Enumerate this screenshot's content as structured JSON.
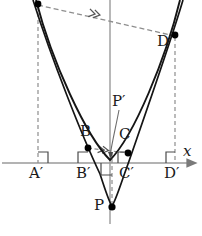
{
  "figure": {
    "width": 202,
    "height": 236,
    "background": "#ffffff",
    "colors": {
      "curve": "#111111",
      "dashed": "#808080",
      "axis": "#9a9a9a",
      "point": "#000000",
      "text": "#1a1a1a"
    }
  },
  "axes": {
    "x_axis_label": "x",
    "x_axis_y": 163,
    "y_axis_x": 110,
    "x_axis_arrow": true
  },
  "points": [
    {
      "id": "A",
      "label": "",
      "x": 38,
      "y": 4,
      "dot": true
    },
    {
      "id": "B",
      "label": "B",
      "x": 88,
      "y": 148,
      "dot": true,
      "label_x": 80,
      "label_y": 128
    },
    {
      "id": "C",
      "label": "C",
      "x": 128,
      "y": 153,
      "dot": true,
      "label_x": 120,
      "label_y": 131
    },
    {
      "id": "D",
      "label": "D",
      "x": 175,
      "y": 35,
      "dot": true,
      "label_x": 158,
      "label_y": 38
    },
    {
      "id": "P",
      "label": "P",
      "x": 112,
      "y": 207,
      "dot": true,
      "label_x": 96,
      "label_y": 200
    },
    {
      "id": "Pp",
      "label": "P′",
      "x": 118,
      "y": 155,
      "dot": false,
      "label_x": 113,
      "label_y": 96
    }
  ],
  "foot_points": [
    {
      "id": "Ap",
      "label": "A′",
      "x": 38,
      "label_x": 30,
      "label_y": 167
    },
    {
      "id": "Bp",
      "label": "B′",
      "x": 88,
      "label_x": 78,
      "label_y": 167
    },
    {
      "id": "Cp",
      "label": "C′",
      "x": 128,
      "label_x": 120,
      "label_y": 167
    },
    {
      "id": "Dp",
      "label": "D′",
      "x": 175,
      "label_x": 165,
      "label_y": 167
    }
  ],
  "right_angle_marks": [
    {
      "at": "A'",
      "x": 38,
      "y": 163
    },
    {
      "at": "B'",
      "x": 88,
      "y": 163
    },
    {
      "at": "C'",
      "x": 128,
      "y": 163
    },
    {
      "at": "D'",
      "x": 175,
      "y": 163
    },
    {
      "at": "P-foot",
      "x": 102,
      "y": 163,
      "rotated": true
    }
  ],
  "chord": {
    "name": "chord-AD",
    "from": "A",
    "to": "D",
    "style": "dashed",
    "arrow_marker": "double-chevron",
    "arrow_x": 95,
    "arrow_y": 14
  },
  "tangent_chord": {
    "name": "chord-BC",
    "from": "B",
    "to": "C",
    "style": "dashed",
    "arrow_marker": "double-chevron",
    "arrow_x": 104,
    "arrow_y": 150
  },
  "curves": [
    {
      "name": "outer-parabola",
      "note": "wide parabola through A and D, vertex near (110,160)"
    },
    {
      "name": "inner-parabola",
      "note": "narrow parabola through B and C, vertex near (112,207) at P"
    }
  ],
  "legend_note": "Geometric construction diagram — no interactive controls"
}
